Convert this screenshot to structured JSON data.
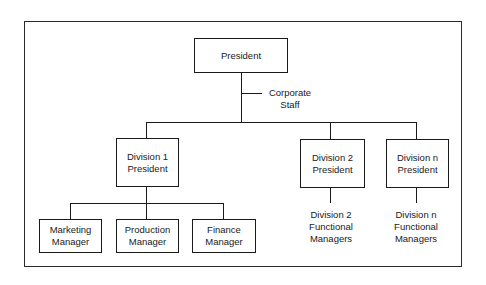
{
  "chart": {
    "type": "organization-chart",
    "root": {
      "label": "President",
      "staff": [
        "Corporate",
        "Staff"
      ]
    },
    "divisions": [
      {
        "lines": [
          "Division 1",
          "President"
        ],
        "reports": [
          {
            "lines": [
              "Marketing",
              "Manager"
            ]
          },
          {
            "lines": [
              "Production",
              "Manager"
            ]
          },
          {
            "lines": [
              "Finance",
              "Manager"
            ]
          }
        ]
      },
      {
        "lines": [
          "Division 2",
          "President"
        ],
        "functional": [
          "Division 2",
          "Functional",
          "Managers"
        ]
      },
      {
        "lines": [
          "Division n",
          "President"
        ],
        "functional": [
          "Division n",
          "Functional",
          "Managers"
        ]
      }
    ]
  },
  "colors": {
    "line": "#1a1a1a",
    "background": "#ffffff"
  }
}
